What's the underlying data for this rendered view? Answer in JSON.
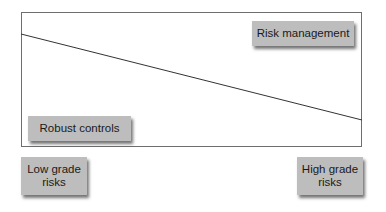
{
  "diagram": {
    "labels": {
      "top_right": "Risk management",
      "bottom_left_inside": "Robust controls",
      "axis_left": "Low grade\nrisks",
      "axis_left_line1": "Low grade",
      "axis_left_line2": "risks",
      "axis_right_line1": "High grade",
      "axis_right_line2": "risks"
    },
    "trend_line": {
      "x1": 21,
      "y1": 34,
      "x2": 362,
      "y2": 120,
      "color": "#333333"
    },
    "colors": {
      "box_fill": "#bdbdbd",
      "frame": "#6e6e6e",
      "background": "#ffffff"
    }
  }
}
